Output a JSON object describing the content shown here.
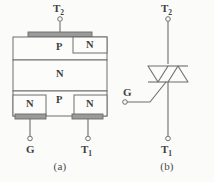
{
  "figure": {
    "panels": [
      {
        "id": "a",
        "caption": "(a)",
        "type": "cross-section",
        "terminals": [
          {
            "name": "T2",
            "label_main": "T",
            "label_sub": "2",
            "position": "top"
          },
          {
            "name": "G",
            "label_main": "G",
            "label_sub": "",
            "position": "bottom-left"
          },
          {
            "name": "T1",
            "label_main": "T",
            "label_sub": "1",
            "position": "bottom-right"
          }
        ],
        "regions": [
          {
            "id": "top-p",
            "label": "P",
            "row": 1,
            "side": "left"
          },
          {
            "id": "top-n",
            "label": "N",
            "row": 1,
            "side": "right"
          },
          {
            "id": "middle-n",
            "label": "N",
            "row": 2,
            "side": "full"
          },
          {
            "id": "bottom-n-l",
            "label": "N",
            "row": 3,
            "side": "left"
          },
          {
            "id": "bottom-p",
            "label": "P",
            "row": 3,
            "side": "center"
          },
          {
            "id": "bottom-n-r",
            "label": "N",
            "row": 3,
            "side": "right"
          }
        ],
        "contacts": [
          {
            "id": "top-contact",
            "terminal": "T2"
          },
          {
            "id": "gate-contact",
            "terminal": "G"
          },
          {
            "id": "bottom-contact",
            "terminal": "T1"
          }
        ]
      },
      {
        "id": "b",
        "caption": "(b)",
        "type": "circuit-symbol",
        "symbol": "triac",
        "terminals": [
          {
            "name": "T2",
            "label_main": "T",
            "label_sub": "2",
            "position": "top"
          },
          {
            "name": "G",
            "label_main": "G",
            "label_sub": "",
            "position": "left"
          },
          {
            "name": "T1",
            "label_main": "T",
            "label_sub": "1",
            "position": "bottom"
          }
        ]
      }
    ]
  },
  "colors": {
    "background": "#fbfbf9",
    "line": "#6e6e6e",
    "metal_fill": "#9a9a9a",
    "metal_stroke": "#6a6a6a",
    "region_fill": "#fcfcfa",
    "text": "#3f3f3f"
  }
}
